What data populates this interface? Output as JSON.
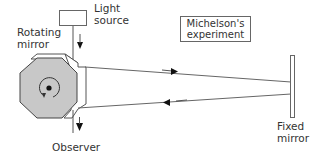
{
  "diagram": {
    "title_line1": "Michelson's",
    "title_line2": "experiment",
    "labels": {
      "light_source_line1": "Light",
      "light_source_line2": "source",
      "rotating_mirror_line1": "Rotating",
      "rotating_mirror_line2": "mirror",
      "observer": "Observer",
      "fixed_mirror_line1": "Fixed",
      "fixed_mirror_line2": "mirror"
    },
    "components": [
      {
        "name": "light-source",
        "shape": "rectangle"
      },
      {
        "name": "rotating-mirror",
        "shape": "octagonal prism",
        "rotation": "counter-clockwise"
      },
      {
        "name": "fixed-mirror",
        "shape": "thin rectangle"
      },
      {
        "name": "observer",
        "shape": "arrow target"
      }
    ],
    "rays": [
      {
        "from": "rotating-mirror",
        "to": "fixed-mirror",
        "direction": "outgoing"
      },
      {
        "from": "fixed-mirror",
        "to": "rotating-mirror",
        "direction": "returning"
      }
    ],
    "colors": {
      "line": "#555555",
      "mirror_fill": "#c8c8c8",
      "side_fill": "#ffffff",
      "arrow": "#111111"
    }
  }
}
